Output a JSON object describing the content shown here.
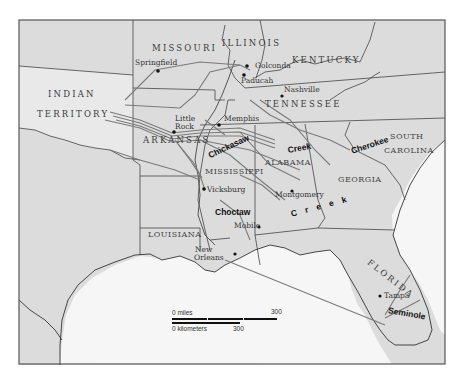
{
  "map": {
    "title": "Indian Removal routes, southeastern United States",
    "colors": {
      "land": "#dcdcdc",
      "indian_territory": "#e9e9e9",
      "sea": "#f6f6f6",
      "frame": "#555555",
      "border": "#444444",
      "route": "#7a7a7a",
      "text": "#333333"
    },
    "states": {
      "missouri": "MISSOURI",
      "illinois": "ILLINOIS",
      "kentucky": "KENTUCKY",
      "tennessee": "TENNESSEE",
      "indian_territory_1": "INDIAN",
      "indian_territory_2": "TERRITORY",
      "arkansas": "ARKANSAS",
      "mississippi": "MISSISSIPPI",
      "alabama": "ALABAMA",
      "georgia": "GEORGIA",
      "south_carolina_1": "SOUTH",
      "south_carolina_2": "CAROLINA",
      "louisiana": "LOUISIANA",
      "florida": "FLORIDA"
    },
    "cities": {
      "springfield": "Springfield",
      "golconda": "Golconda",
      "paducah": "Paducah",
      "nashville": "Nashville",
      "little_rock_1": "Little",
      "little_rock_2": "Rock",
      "memphis": "Memphis",
      "vicksburg": "Vicksburg",
      "montgomery": "Montgomery",
      "mobile": "Mobile",
      "new_orleans_1": "New",
      "new_orleans_2": "Orleans",
      "tampa": "Tampa"
    },
    "tribes": {
      "chickasaw": "Chickasaw",
      "creek_north": "Creek",
      "cherokee": "Cherokee",
      "choctaw": "Choctaw",
      "creek_south": "C r e e k",
      "seminole": "Seminole"
    },
    "scale": {
      "miles_label": "0 miles",
      "miles_max": "300",
      "km_label": "0 kilometers",
      "km_max": "300"
    }
  }
}
